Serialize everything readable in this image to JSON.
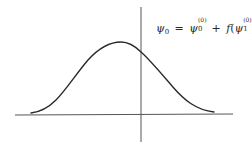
{
  "figure": {
    "type": "diagram",
    "colors": {
      "background": "#ffffff",
      "axis": "#555555",
      "curve": "#2a2a2a",
      "text": "#2a2a2a"
    },
    "axes": {
      "horizontal": {
        "x1": 15,
        "y1": 115,
        "x2": 233,
        "y2": 114
      },
      "vertical": {
        "x1": 141,
        "y1": 7,
        "x2": 141,
        "y2": 142
      }
    },
    "curve": {
      "shape": "gaussian",
      "start": [
        31,
        113
      ],
      "peak": [
        121,
        42
      ],
      "axis_crossing": [
        141,
        52
      ],
      "end": [
        214,
        112
      ]
    },
    "equation": {
      "lhs_symbol": "ψ",
      "lhs_sub": "0",
      "equals": "=",
      "term1_symbol": "ψ",
      "term1_sub": "0",
      "term1_sup": "(0)",
      "plus": "+",
      "fn": "f",
      "open_paren": "(",
      "term2_symbol": "ψ",
      "term2_sub": "1",
      "term2_sup": "(0)",
      "close_paren": ")",
      "full_text": "ψ0 = ψ0(0) + f(ψ1(0))"
    }
  }
}
